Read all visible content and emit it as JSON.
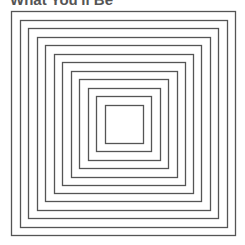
{
  "title": "What You'll Be",
  "figure": {
    "type": "concentric-squares",
    "count": 12,
    "stroke_color": "#555555",
    "outer": {
      "x": 11,
      "y": 11,
      "size": 224
    },
    "inner": {
      "x": 105,
      "y": 105,
      "size": 38
    }
  }
}
